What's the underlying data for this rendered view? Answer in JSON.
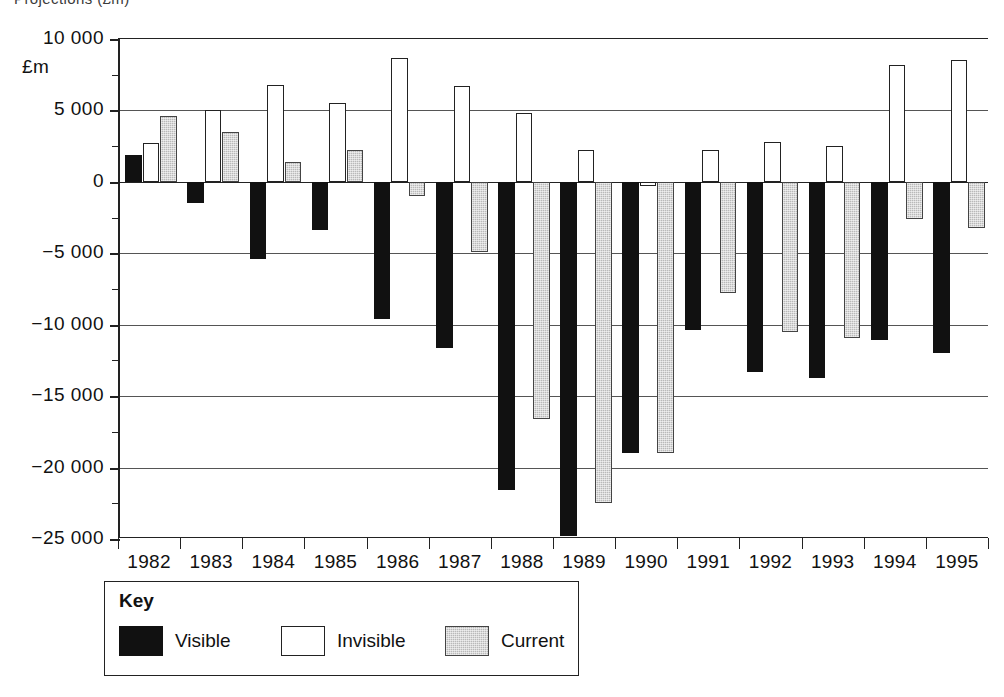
{
  "title_partial": "Projections (£m)",
  "unit_label": "£m",
  "axis": {
    "y_ticks": [
      "10 000",
      "5 000",
      "0",
      "−5 000",
      "−10 000",
      "−15 000",
      "−20 000",
      "−25 000"
    ],
    "x_ticks": [
      "1982",
      "1983",
      "1984",
      "1985",
      "1986",
      "1987",
      "1988",
      "1989",
      "1990",
      "1991",
      "1992",
      "1993",
      "1994",
      "1995"
    ]
  },
  "legend": {
    "title": "Key",
    "entries": [
      {
        "label": "Visible",
        "swatch": "visible",
        "color": "#111111"
      },
      {
        "label": "Invisible",
        "swatch": "invisible",
        "color": "#ffffff"
      },
      {
        "label": "Current",
        "swatch": "current",
        "color": "#b9b9b9"
      }
    ]
  },
  "chart_data": {
    "type": "bar",
    "title": "Projections (£m)",
    "xlabel": "",
    "ylabel": "£m",
    "ylim": [
      -25000,
      10000
    ],
    "ytick_step": 5000,
    "minor_tick_step": 2500,
    "grid": true,
    "legend_position": "below-left",
    "categories": [
      "1982",
      "1983",
      "1984",
      "1985",
      "1986",
      "1987",
      "1988",
      "1989",
      "1990",
      "1991",
      "1992",
      "1993",
      "1994",
      "1995"
    ],
    "series": [
      {
        "name": "Visible",
        "color": "#111111",
        "values": [
          1900,
          -1500,
          -5400,
          -3400,
          -9600,
          -11600,
          -21600,
          -24800,
          -19000,
          -10400,
          -13300,
          -13700,
          -11100,
          -12000
        ]
      },
      {
        "name": "Invisible",
        "color": "#ffffff",
        "values": [
          2700,
          5000,
          6800,
          5500,
          8700,
          6700,
          4800,
          2200,
          -300,
          2200,
          2800,
          2500,
          8200,
          8500
        ]
      },
      {
        "name": "Current",
        "color": "#b9b9b9",
        "values": [
          4600,
          3500,
          1400,
          2200,
          -1000,
          -4900,
          -16600,
          -22500,
          -19000,
          -7800,
          -10500,
          -10900,
          -2600,
          -3200
        ]
      }
    ]
  }
}
